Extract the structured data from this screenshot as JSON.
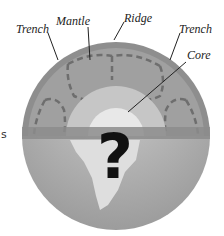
{
  "diagram": {
    "labels": {
      "trench_left": "Trench",
      "mantle": "Mantle",
      "ridge": "Ridge",
      "trench_right": "Trench",
      "core": "Core"
    },
    "core_symbol": "?",
    "stray_text": "s",
    "colors": {
      "crust_band": "#8a8a8a",
      "mantle": "#9a9a9a",
      "outer_core": "#c4c4c4",
      "inner_core": "#e6e6e6",
      "lower_hemisphere": "#b0b0b0",
      "continent": "#dcdcdc",
      "question_mark": "#111111"
    }
  }
}
